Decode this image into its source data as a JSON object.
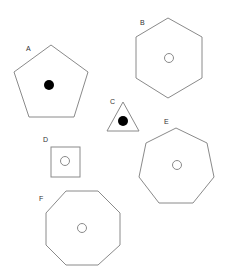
{
  "diagram": {
    "background": "#ffffff",
    "stroke_color": "#8a8a8a",
    "shapes": [
      {
        "label": "A",
        "type": "pentagon",
        "marker": "filled-dot"
      },
      {
        "label": "B",
        "type": "hexagon",
        "marker": "hollow-circle"
      },
      {
        "label": "C",
        "type": "triangle",
        "marker": "filled-dot"
      },
      {
        "label": "D",
        "type": "square",
        "marker": "hollow-circle"
      },
      {
        "label": "E",
        "type": "heptagon",
        "marker": "hollow-circle"
      },
      {
        "label": "F",
        "type": "octagon",
        "marker": "hollow-circle"
      }
    ]
  }
}
